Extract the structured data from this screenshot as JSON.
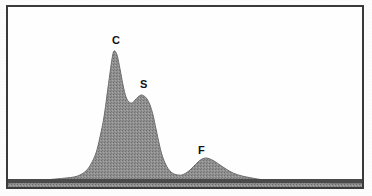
{
  "figure": {
    "background_color": "#fdfdfd",
    "frame_color": "#3a3a3a",
    "baseline_color": "#4a4a4a",
    "fill_color": "#8f8f8f",
    "outline_color": "#6e6e6e"
  },
  "labels": {
    "carbon": "C",
    "sulfur": "S",
    "fluorine": "F"
  },
  "chart_data": {
    "type": "area",
    "title": "",
    "xlabel": "",
    "ylabel": "",
    "xlim": [
      0,
      354
    ],
    "ylim": [
      0,
      180
    ],
    "grid": false,
    "legend_position": "none",
    "annotations": [
      {
        "text": "C",
        "x": 104,
        "y": 28,
        "peak_x": 104,
        "peak_y": 44
      },
      {
        "text": "S",
        "x": 132,
        "y": 72,
        "peak_x": 132,
        "peak_y": 88
      },
      {
        "text": "F",
        "x": 190,
        "y": 138,
        "peak_x": 192,
        "peak_y": 152
      }
    ],
    "series": [
      {
        "name": "spectrum",
        "x": [
          0,
          12,
          24,
          36,
          48,
          58,
          66,
          72,
          78,
          83,
          88,
          92,
          96,
          99,
          102,
          104,
          106,
          109,
          112,
          115,
          118,
          121,
          124,
          127,
          130,
          133,
          136,
          139,
          142,
          145,
          148,
          151,
          154,
          158,
          162,
          166,
          170,
          174,
          178,
          182,
          186,
          190,
          194,
          198,
          202,
          206,
          212,
          218,
          225,
          234,
          244,
          256,
          270,
          286,
          304,
          324,
          344,
          354
        ],
        "y": [
          176,
          175,
          174,
          173,
          172,
          171,
          170,
          168,
          164,
          157,
          146,
          130,
          110,
          88,
          66,
          52,
          44,
          48,
          62,
          78,
          90,
          95,
          96,
          93,
          90,
          88,
          89,
          92,
          98,
          108,
          122,
          136,
          148,
          158,
          164,
          167,
          168,
          168,
          166,
          163,
          159,
          155,
          152,
          151,
          152,
          154,
          158,
          162,
          166,
          169,
          171,
          173,
          174,
          175,
          175,
          176,
          176,
          176
        ]
      }
    ]
  }
}
